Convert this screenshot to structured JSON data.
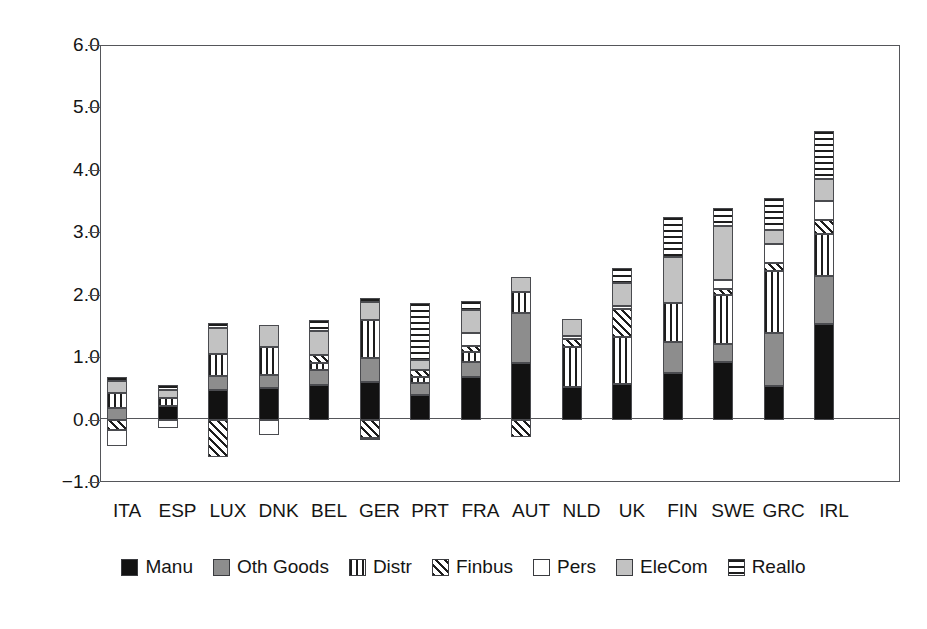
{
  "chart_data": {
    "type": "bar",
    "stacked": true,
    "title": "",
    "subtitle": "",
    "xlabel": "",
    "ylabel": "",
    "ylim": [
      -1.0,
      6.0
    ],
    "ytick_labels": [
      "6.0",
      "5.0",
      "4.0",
      "3.0",
      "2.0",
      "1.0",
      "0.0",
      "−1.0"
    ],
    "ytick_values": [
      6.0,
      5.0,
      4.0,
      3.0,
      2.0,
      1.0,
      0.0,
      -1.0
    ],
    "grid": false,
    "legend_position": "bottom",
    "categories": [
      "ITA",
      "ESP",
      "LUX",
      "DNK",
      "BEL",
      "GER",
      "PRT",
      "FRA",
      "AUT",
      "NLD",
      "UK",
      "FIN",
      "SWE",
      "GRC",
      "IRL"
    ],
    "series": [
      {
        "name": "Manu",
        "pattern": "solid-black",
        "color": "#121212",
        "values": [
          0.0,
          0.21,
          0.48,
          0.51,
          0.56,
          0.6,
          0.4,
          0.68,
          0.91,
          0.52,
          0.57,
          0.74,
          0.92,
          0.53,
          1.53
        ]
      },
      {
        "name": "Oth Goods",
        "pattern": "solid-gray",
        "color": "#8d8d8d",
        "values": [
          0.19,
          0.0,
          0.22,
          0.21,
          0.23,
          0.39,
          0.19,
          0.25,
          0.79,
          0.0,
          0.0,
          0.5,
          0.29,
          0.86,
          0.77
        ]
      },
      {
        "name": "Distr",
        "pattern": "vertical-stripes",
        "color": "#ffffff",
        "values": [
          0.23,
          0.14,
          0.35,
          0.44,
          0.11,
          0.6,
          0.09,
          0.15,
          0.35,
          0.64,
          0.76,
          0.62,
          0.78,
          0.99,
          0.68
        ]
      },
      {
        "name": "Finbus",
        "pattern": "diagonal-hatch",
        "color": "#ffffff",
        "values": [
          -0.17,
          0.0,
          -0.6,
          0.0,
          0.13,
          -0.3,
          0.11,
          0.1,
          -0.28,
          0.13,
          0.44,
          0.0,
          0.1,
          0.13,
          0.21
        ]
      },
      {
        "name": "Pers",
        "pattern": "white",
        "color": "#ffffff",
        "values": [
          -0.25,
          -0.14,
          0.0,
          -0.25,
          0.0,
          -0.03,
          0.0,
          0.21,
          0.0,
          0.05,
          0.05,
          0.0,
          0.14,
          0.3,
          0.31
        ]
      },
      {
        "name": "EleCom",
        "pattern": "light-gray",
        "color": "#c2c2c2",
        "values": [
          0.2,
          0.13,
          0.41,
          0.36,
          0.39,
          0.29,
          0.16,
          0.36,
          0.23,
          0.27,
          0.37,
          0.74,
          0.87,
          0.22,
          0.36
        ]
      },
      {
        "name": "Reallo",
        "pattern": "horizontal-stripes",
        "color": "#ffffff",
        "values": [
          0.06,
          0.08,
          0.09,
          0.0,
          0.18,
          0.06,
          0.92,
          0.15,
          0.0,
          0.0,
          0.24,
          0.65,
          0.29,
          0.52,
          0.77
        ]
      }
    ]
  },
  "legend": {
    "items": [
      {
        "label": "Manu",
        "swatch": "solid-black-swatch"
      },
      {
        "label": "Oth Goods",
        "swatch": "solid-gray-swatch"
      },
      {
        "label": "Distr",
        "swatch": "vertical-stripe-swatch"
      },
      {
        "label": "Finbus",
        "swatch": "diagonal-hatch-swatch"
      },
      {
        "label": "Pers",
        "swatch": "white-swatch"
      },
      {
        "label": "EleCom",
        "swatch": "light-gray-swatch"
      },
      {
        "label": "Reallo",
        "swatch": "horizontal-stripe-swatch"
      }
    ]
  }
}
